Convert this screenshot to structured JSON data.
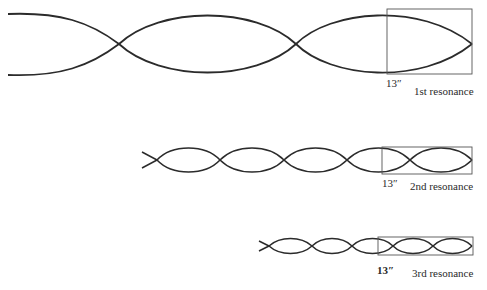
{
  "diagram": {
    "type": "standing-wave-resonances",
    "stroke_color": "#2b2b2b",
    "rows": [
      {
        "name": "1st resonance",
        "label": "1st resonance",
        "dimension": "13″",
        "start_x": 8,
        "end_x": 472,
        "mid_y": 44,
        "amplitude": 30,
        "nodes_x": [
          119,
          296,
          472
        ],
        "box": {
          "x": 387,
          "y": 9,
          "w": 85,
          "h": 65
        }
      },
      {
        "name": "2nd resonance",
        "label": "2nd resonance",
        "dimension": "13″",
        "start_x": 142,
        "end_x": 472,
        "mid_y": 160,
        "amplitude": 12,
        "nodes_x": [
          157,
          220,
          284,
          347,
          410,
          472
        ],
        "box": {
          "x": 382,
          "y": 147,
          "w": 90,
          "h": 27
        }
      },
      {
        "name": "3rd resonance",
        "label": "3rd resonance",
        "dimension": "13″",
        "start_x": 259,
        "end_x": 472,
        "mid_y": 246,
        "amplitude": 8,
        "nodes_x": [
          269,
          312,
          352,
          393,
          433,
          472
        ],
        "box": {
          "x": 378,
          "y": 237,
          "w": 95,
          "h": 18
        }
      }
    ]
  },
  "labels": {
    "row1_dimension": "13″",
    "row1_name": "1st resonance",
    "row2_dimension": "13″",
    "row2_name": "2nd resonance",
    "row3_dimension": "13″",
    "row3_name": "3rd resonance"
  }
}
